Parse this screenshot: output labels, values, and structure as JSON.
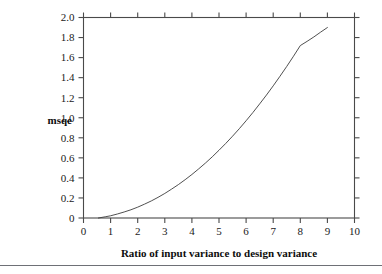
{
  "chart_data": {
    "type": "line",
    "title": "",
    "xlabel": "Ratio of input variance to design variance",
    "ylabel": "msqe",
    "xlim": [
      0,
      10
    ],
    "ylim": [
      0,
      2.0
    ],
    "grid": false,
    "legend": null,
    "x_ticks": [
      0,
      1,
      2,
      3,
      4,
      5,
      6,
      7,
      8,
      9,
      10
    ],
    "x_tick_labels": [
      "0",
      "1",
      "2",
      "3",
      "4",
      "5",
      "6",
      "7",
      "8",
      "9",
      "10"
    ],
    "y_ticks": [
      0,
      0.2,
      0.4,
      0.6,
      0.8,
      1.0,
      1.2,
      1.4,
      1.6,
      1.8,
      2.0
    ],
    "y_tick_labels": [
      "0",
      "0.2",
      "0.4",
      "0.6",
      "0.8",
      "1.0",
      "1.2",
      "1.4",
      "1.6",
      "1.8",
      "2.0"
    ],
    "series": [
      {
        "name": "msqe",
        "x": [
          0.55,
          0.8,
          1.0,
          1.25,
          1.5,
          1.75,
          2.0,
          2.25,
          2.5,
          2.75,
          3.0,
          3.25,
          3.5,
          3.75,
          4.0,
          4.25,
          4.5,
          4.75,
          5.0,
          5.25,
          5.5,
          5.75,
          6.0,
          6.25,
          6.5,
          6.75,
          7.0,
          7.25,
          7.5,
          7.75,
          8.0,
          8.25,
          8.5,
          8.75,
          9.0
        ],
        "y": [
          0.0,
          0.012,
          0.022,
          0.04,
          0.06,
          0.082,
          0.108,
          0.138,
          0.17,
          0.206,
          0.245,
          0.288,
          0.333,
          0.382,
          0.434,
          0.49,
          0.548,
          0.61,
          0.676,
          0.744,
          0.816,
          0.891,
          0.97,
          1.052,
          1.138,
          1.226,
          1.318,
          1.414,
          1.512,
          1.614,
          1.72,
          1.762,
          1.806,
          1.854,
          1.9
        ]
      }
    ]
  },
  "figure": {
    "y_axis_label": "msqe",
    "x_axis_label": "Ratio of input variance to design variance"
  }
}
